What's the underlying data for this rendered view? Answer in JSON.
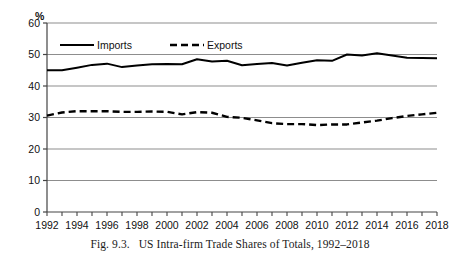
{
  "figure": {
    "caption_label": "Fig. 9.3.",
    "caption_text": "US Intra-firm Trade Shares of Totals, 1992–2018"
  },
  "chart_data": {
    "type": "line",
    "title": "",
    "subtitle": "",
    "xlabel": "",
    "ylabel": "",
    "unit_label": "%",
    "grid": true,
    "legend_position": "top-left-inside",
    "xlim": [
      1992,
      2018
    ],
    "ylim": [
      0,
      60
    ],
    "ytick_values": [
      0,
      10,
      20,
      30,
      40,
      50,
      60
    ],
    "ytick_labels": [
      "0",
      "10",
      "20",
      "30",
      "40",
      "50",
      "60"
    ],
    "xtick_labels": [
      "1992",
      "1994",
      "1996",
      "1998",
      "2000",
      "2002",
      "2004",
      "2006",
      "2008",
      "2010",
      "2012",
      "2014",
      "2016",
      "2018"
    ],
    "x": [
      1992,
      1993,
      1994,
      1995,
      1996,
      1997,
      1998,
      1999,
      2000,
      2001,
      2002,
      2003,
      2004,
      2005,
      2006,
      2007,
      2008,
      2009,
      2010,
      2011,
      2012,
      2013,
      2014,
      2015,
      2016,
      2017,
      2018
    ],
    "series": [
      {
        "name": "Imports",
        "style": "solid",
        "color": "#000000",
        "values": [
          45.0,
          45.0,
          45.8,
          46.7,
          47.1,
          46.0,
          46.5,
          46.9,
          47.0,
          46.9,
          48.5,
          47.8,
          48.0,
          46.6,
          47.0,
          47.3,
          46.5,
          47.4,
          48.2,
          48.0,
          50.0,
          49.7,
          50.4,
          49.7,
          49.0,
          48.9,
          48.8
        ]
      },
      {
        "name": "Exports",
        "style": "dashed",
        "color": "#000000",
        "values": [
          30.6,
          31.6,
          32.0,
          32.0,
          32.0,
          31.8,
          31.8,
          31.9,
          31.8,
          31.0,
          31.7,
          31.5,
          30.2,
          29.9,
          29.1,
          28.2,
          27.9,
          27.9,
          27.6,
          27.8,
          27.8,
          28.4,
          29.0,
          29.8,
          30.5,
          31.0,
          31.5
        ]
      }
    ],
    "legend": [
      {
        "label": "Imports",
        "style": "solid"
      },
      {
        "label": "Exports",
        "style": "dashed"
      }
    ]
  }
}
